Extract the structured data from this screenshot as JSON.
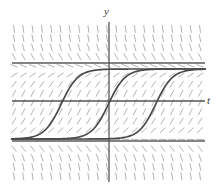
{
  "figure": {
    "title": "",
    "background_color": "#ffffff",
    "width": 220,
    "height": 189
  },
  "axes": {
    "y_axis_label": "y",
    "t_axis_label": "t",
    "origin": {
      "x": 109,
      "y": 101
    },
    "y_axis_x": 109,
    "y_axis_top": 22,
    "y_axis_bottom": 182,
    "t_axis_y": 101,
    "t_axis_left": 12,
    "t_axis_right": 205,
    "axis_color": "#555555",
    "axis_width": 1.3
  },
  "chart_data": {
    "type": "line",
    "title": "",
    "xlabel": "t",
    "ylabel": "y",
    "grid": false,
    "legend": null,
    "xlim": [
      -5.0,
      5.0
    ],
    "ylim": [
      -2.2,
      2.2
    ],
    "plot_box": {
      "left": 12,
      "right": 205,
      "top": 27,
      "bottom": 181
    },
    "equilibria": [
      {
        "name": "upper-equilibrium",
        "y_value": 1.0,
        "pixel_y": 63,
        "stable": true
      },
      {
        "name": "lower-equilibrium",
        "y_value": -1.0,
        "pixel_y": 141,
        "stable": true
      }
    ],
    "series": [
      {
        "name": "solution-curve-1",
        "shift": -2.45,
        "inflection_pixel_x": 62,
        "color": "#4a4a4a",
        "width": 1.7
      },
      {
        "name": "solution-curve-2",
        "shift": 0.0,
        "inflection_pixel_x": 109,
        "color": "#4a4a4a",
        "width": 1.7
      },
      {
        "name": "solution-curve-3",
        "shift": 2.45,
        "inflection_pixel_x": 156,
        "color": "#4a4a4a",
        "width": 1.7
      }
    ],
    "slope_field": {
      "color": "#b4b4b4",
      "stroke_width": 1.0,
      "tick_length": 7,
      "columns": 21,
      "rows": 17,
      "x_start": 14,
      "x_step": 9.3,
      "y_start": 29,
      "y_step": 9.2,
      "note": "Short tangent segments; near y = +/-1 segments are horizontal, steepest near y = 0."
    }
  },
  "colors": {
    "curve": "#4a4a4a",
    "equilibrium": "#5a5a5a",
    "axis": "#555555",
    "slope_field": "#b4b4b4",
    "background": "#ffffff",
    "label": "#3a3a3a"
  }
}
